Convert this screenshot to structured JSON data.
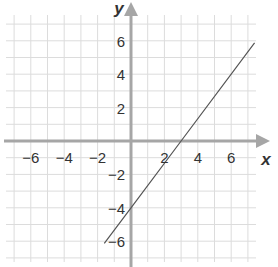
{
  "chart_data": {
    "type": "line",
    "title": "",
    "xlabel": "x",
    "ylabel": "y",
    "xlim": [
      -7.5,
      7.5
    ],
    "ylim": [
      -7.3,
      7.5
    ],
    "grid": true,
    "x_ticks": [
      -6,
      -4,
      -2,
      2,
      4,
      6
    ],
    "y_ticks": [
      6,
      4,
      2,
      -2,
      -4,
      -6
    ],
    "x_tick_labels": [
      "−6",
      "−4",
      "−2",
      "2",
      "4",
      "6"
    ],
    "y_tick_labels": [
      "6",
      "4",
      "2",
      "−2",
      "−4",
      "−6"
    ],
    "series": [
      {
        "name": "line",
        "equation": "y = (4/3)x - 4",
        "x": [
          -1.6,
          0,
          3,
          7.4
        ],
        "y": [
          -6.13,
          -4,
          0,
          5.87
        ]
      }
    ]
  },
  "colors": {
    "grid": "#dcdcdc",
    "axis": "#a6a6a6",
    "line": "#555555",
    "text": "#333333"
  }
}
